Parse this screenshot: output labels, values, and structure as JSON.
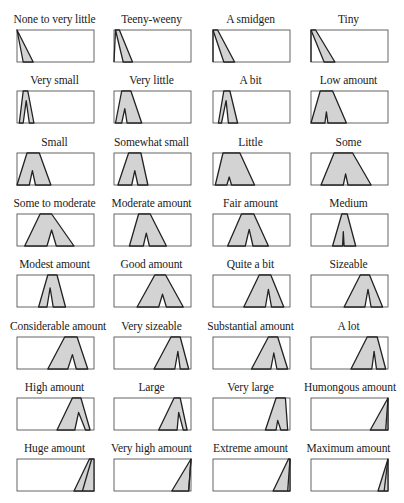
{
  "figure": {
    "colors": {
      "fill": "#d3d3d3",
      "stroke": "#222222",
      "box": "#555555",
      "background": "#ffffff"
    },
    "cells": [
      {
        "label": "None to very little",
        "outer": [
          [
            0,
            0
          ],
          [
            0,
            0
          ],
          [
            21,
            100
          ],
          [
            8,
            100
          ]
        ],
        "notch": null
      },
      {
        "label": "Teeny-weeny",
        "outer": [
          [
            2,
            0
          ],
          [
            7,
            0
          ],
          [
            24,
            100
          ],
          [
            12,
            100
          ]
        ],
        "notch": null,
        "left_line": [
          [
            2,
            0
          ],
          [
            0,
            100
          ]
        ]
      },
      {
        "label": "A smidgen",
        "outer": [
          [
            0,
            0
          ],
          [
            6,
            0
          ],
          [
            28,
            100
          ],
          [
            14,
            100
          ]
        ],
        "notch": null,
        "left_line": [
          [
            0,
            0
          ],
          [
            0,
            100
          ]
        ]
      },
      {
        "label": "Tiny",
        "outer": [
          [
            0,
            0
          ],
          [
            6,
            0
          ],
          [
            31,
            100
          ],
          [
            17,
            100
          ]
        ],
        "notch": null,
        "left_line": [
          [
            0,
            0
          ],
          [
            0,
            100
          ]
        ]
      },
      {
        "label": "Very small",
        "outer": [
          [
            8,
            0
          ],
          [
            14,
            0
          ],
          [
            22,
            100
          ],
          [
            3,
            100
          ]
        ],
        "notch": [
          [
            8,
            100
          ],
          [
            12,
            30
          ],
          [
            16,
            100
          ]
        ]
      },
      {
        "label": "Very little",
        "outer": [
          [
            10,
            0
          ],
          [
            22,
            0
          ],
          [
            36,
            100
          ],
          [
            2,
            100
          ]
        ],
        "notch": [
          [
            10,
            100
          ],
          [
            14,
            55
          ],
          [
            17,
            100
          ]
        ]
      },
      {
        "label": "A bit",
        "outer": [
          [
            14,
            0
          ],
          [
            22,
            0
          ],
          [
            32,
            100
          ],
          [
            7,
            100
          ]
        ],
        "notch": [
          [
            11,
            100
          ],
          [
            17,
            30
          ],
          [
            20,
            100
          ]
        ]
      },
      {
        "label": "Low amount",
        "outer": [
          [
            12,
            0
          ],
          [
            28,
            0
          ],
          [
            46,
            100
          ],
          [
            0,
            100
          ]
        ],
        "notch": [
          [
            18,
            100
          ],
          [
            20,
            65
          ],
          [
            22,
            100
          ]
        ]
      },
      {
        "label": "Small",
        "outer": [
          [
            13,
            0
          ],
          [
            29,
            0
          ],
          [
            44,
            100
          ],
          [
            0,
            100
          ]
        ],
        "notch": [
          [
            16,
            100
          ],
          [
            20,
            55
          ],
          [
            24,
            100
          ]
        ]
      },
      {
        "label": "Somewhat small",
        "outer": [
          [
            19,
            0
          ],
          [
            35,
            0
          ],
          [
            44,
            100
          ],
          [
            5,
            100
          ]
        ],
        "notch": [
          [
            23,
            100
          ],
          [
            27,
            55
          ],
          [
            31,
            100
          ]
        ]
      },
      {
        "label": "Little",
        "outer": [
          [
            13,
            0
          ],
          [
            35,
            0
          ],
          [
            54,
            100
          ],
          [
            3,
            100
          ]
        ],
        "notch": [
          [
            18,
            100
          ],
          [
            21,
            75
          ],
          [
            24,
            100
          ]
        ]
      },
      {
        "label": "Some",
        "outer": [
          [
            30,
            0
          ],
          [
            54,
            0
          ],
          [
            78,
            100
          ],
          [
            13,
            100
          ]
        ],
        "notch": [
          [
            42,
            100
          ],
          [
            45,
            65
          ],
          [
            48,
            100
          ]
        ]
      },
      {
        "label": "Some to moderate",
        "outer": [
          [
            30,
            0
          ],
          [
            45,
            0
          ],
          [
            74,
            100
          ],
          [
            10,
            100
          ]
        ],
        "notch": [
          [
            39,
            100
          ],
          [
            45,
            50
          ],
          [
            51,
            100
          ]
        ]
      },
      {
        "label": "Moderate amount",
        "outer": [
          [
            32,
            0
          ],
          [
            47,
            0
          ],
          [
            68,
            100
          ],
          [
            20,
            100
          ]
        ],
        "notch": [
          [
            38,
            100
          ],
          [
            42,
            60
          ],
          [
            46,
            100
          ]
        ]
      },
      {
        "label": "Fair amount",
        "outer": [
          [
            37,
            0
          ],
          [
            53,
            0
          ],
          [
            72,
            100
          ],
          [
            19,
            100
          ]
        ],
        "notch": [
          [
            42,
            100
          ],
          [
            47,
            48
          ],
          [
            52,
            100
          ]
        ]
      },
      {
        "label": "Medium",
        "outer": [
          [
            40,
            0
          ],
          [
            47,
            0
          ],
          [
            58,
            100
          ],
          [
            28,
            100
          ]
        ],
        "notch": [
          [
            41,
            100
          ],
          [
            42,
            55
          ],
          [
            43,
            100
          ]
        ]
      },
      {
        "label": "Modest amount",
        "outer": [
          [
            40,
            0
          ],
          [
            52,
            0
          ],
          [
            63,
            100
          ],
          [
            28,
            100
          ]
        ],
        "notch": [
          [
            39,
            100
          ],
          [
            43,
            40
          ],
          [
            47,
            100
          ]
        ]
      },
      {
        "label": "Good amount",
        "outer": [
          [
            53,
            0
          ],
          [
            67,
            0
          ],
          [
            90,
            100
          ],
          [
            30,
            100
          ]
        ],
        "notch": [
          [
            58,
            100
          ],
          [
            63,
            60
          ],
          [
            68,
            100
          ]
        ]
      },
      {
        "label": "Quite a bit",
        "outer": [
          [
            60,
            0
          ],
          [
            75,
            0
          ],
          [
            92,
            100
          ],
          [
            40,
            100
          ]
        ],
        "notch": [
          [
            68,
            100
          ],
          [
            72,
            45
          ],
          [
            76,
            100
          ]
        ]
      },
      {
        "label": "Sizeable",
        "outer": [
          [
            64,
            0
          ],
          [
            76,
            0
          ],
          [
            93,
            100
          ],
          [
            43,
            100
          ]
        ],
        "notch": [
          [
            70,
            100
          ],
          [
            74,
            45
          ],
          [
            78,
            100
          ]
        ]
      },
      {
        "label": "Considerable amount",
        "outer": [
          [
            62,
            0
          ],
          [
            78,
            0
          ],
          [
            92,
            100
          ],
          [
            40,
            100
          ]
        ],
        "notch": [
          [
            66,
            100
          ],
          [
            72,
            55
          ],
          [
            77,
            100
          ]
        ]
      },
      {
        "label": "Very sizeable",
        "outer": [
          [
            74,
            0
          ],
          [
            86,
            0
          ],
          [
            97,
            100
          ],
          [
            52,
            100
          ]
        ],
        "notch": [
          [
            79,
            100
          ],
          [
            83,
            45
          ],
          [
            86,
            100
          ]
        ]
      },
      {
        "label": "Substantial amount",
        "outer": [
          [
            72,
            0
          ],
          [
            84,
            0
          ],
          [
            97,
            100
          ],
          [
            50,
            100
          ]
        ],
        "notch": [
          [
            75,
            100
          ],
          [
            79,
            50
          ],
          [
            83,
            100
          ]
        ]
      },
      {
        "label": "A lot",
        "outer": [
          [
            73,
            0
          ],
          [
            86,
            0
          ],
          [
            97,
            100
          ],
          [
            52,
            100
          ]
        ],
        "notch": [
          [
            79,
            100
          ],
          [
            82,
            45
          ],
          [
            85,
            100
          ]
        ]
      },
      {
        "label": "High amount",
        "outer": [
          [
            72,
            0
          ],
          [
            83,
            0
          ],
          [
            95,
            100
          ],
          [
            52,
            100
          ]
        ],
        "notch": [
          [
            75,
            100
          ],
          [
            80,
            45
          ],
          [
            89,
            100
          ]
        ]
      },
      {
        "label": "Large",
        "outer": [
          [
            78,
            0
          ],
          [
            86,
            0
          ],
          [
            95,
            100
          ],
          [
            58,
            100
          ]
        ],
        "notch": [
          [
            82,
            100
          ],
          [
            84,
            45
          ],
          [
            90,
            100
          ]
        ]
      },
      {
        "label": "Very large",
        "outer": [
          [
            82,
            0
          ],
          [
            94,
            0
          ],
          [
            97,
            100
          ],
          [
            68,
            100
          ]
        ],
        "notch": [
          [
            82,
            100
          ],
          [
            84,
            70
          ],
          [
            88,
            100
          ]
        ]
      },
      {
        "label": "Humongous amount",
        "outer": [
          [
            100,
            0
          ],
          [
            100,
            0
          ],
          [
            100,
            100
          ],
          [
            77,
            100
          ]
        ],
        "notch": null,
        "inner_line": [
          [
            100,
            0
          ],
          [
            97,
            100
          ]
        ]
      },
      {
        "label": "Huge amount",
        "outer": [
          [
            94,
            0
          ],
          [
            100,
            0
          ],
          [
            100,
            100
          ],
          [
            74,
            100
          ]
        ],
        "notch": null,
        "inner_line": [
          [
            97,
            0
          ],
          [
            85,
            100
          ]
        ]
      },
      {
        "label": "Very high amount",
        "outer": [
          [
            100,
            0
          ],
          [
            100,
            0
          ],
          [
            97,
            100
          ],
          [
            75,
            100
          ]
        ],
        "notch": null,
        "inner_line": [
          [
            100,
            0
          ],
          [
            97,
            100
          ]
        ]
      },
      {
        "label": "Extreme amount",
        "outer": [
          [
            98,
            0
          ],
          [
            100,
            0
          ],
          [
            100,
            100
          ],
          [
            78,
            100
          ]
        ],
        "notch": null,
        "inner_line": [
          [
            100,
            0
          ],
          [
            97,
            100
          ]
        ]
      },
      {
        "label": "Maximum amount",
        "outer": [
          [
            100,
            0
          ],
          [
            100,
            0
          ],
          [
            100,
            100
          ],
          [
            87,
            100
          ]
        ],
        "notch": null,
        "inner_line": [
          [
            100,
            0
          ],
          [
            95,
            100
          ]
        ]
      }
    ]
  }
}
